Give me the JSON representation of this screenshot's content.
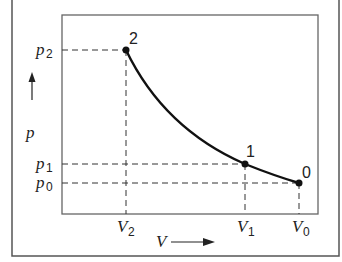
{
  "diagram": {
    "type": "p-V diagram",
    "points": [
      {
        "id": "2",
        "label": "2",
        "v_label": "V",
        "v_sub": "2",
        "p_label": "p",
        "p_sub": "2"
      },
      {
        "id": "1",
        "label": "1",
        "v_label": "V",
        "v_sub": "1",
        "p_label": "p",
        "p_sub": "1"
      },
      {
        "id": "0",
        "label": "0",
        "v_label": "V",
        "v_sub": "0",
        "p_label": "p",
        "p_sub": "0"
      }
    ],
    "y_axis": {
      "label": "p",
      "arrow": "up"
    },
    "x_axis": {
      "label": "V",
      "arrow": "right"
    },
    "curve": "Curve from point 2 (small V, high p) through point 1 to point 0 (large V, low p)"
  }
}
